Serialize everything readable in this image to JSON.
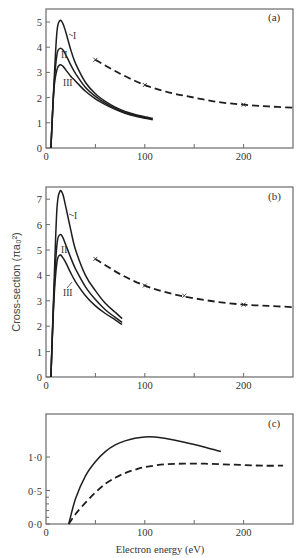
{
  "chart_data": [
    {
      "panel": "(a)",
      "type": "line",
      "xlim": [
        0,
        250
      ],
      "ylim": [
        0,
        5.5
      ],
      "x_ticks": [
        0,
        100,
        200
      ],
      "x_minor_ticks": [
        50,
        150
      ],
      "y_ticks": [
        0,
        1,
        2,
        3,
        4,
        5
      ],
      "series": [
        {
          "name": "I",
          "style": "solid",
          "x": [
            5,
            8,
            11,
            14,
            17,
            20,
            25,
            30,
            40,
            50,
            60,
            70,
            80,
            90,
            100,
            108
          ],
          "y": [
            0,
            2.5,
            4.6,
            5.05,
            4.95,
            4.6,
            3.9,
            3.35,
            2.6,
            2.15,
            1.85,
            1.62,
            1.45,
            1.33,
            1.24,
            1.18
          ]
        },
        {
          "name": "II",
          "style": "solid",
          "x": [
            5,
            8,
            11,
            14,
            17,
            20,
            25,
            30,
            40,
            50,
            60,
            70,
            80,
            90,
            100,
            108
          ],
          "y": [
            0,
            2.4,
            3.7,
            3.95,
            3.9,
            3.7,
            3.3,
            2.95,
            2.4,
            2.05,
            1.78,
            1.57,
            1.41,
            1.3,
            1.21,
            1.15
          ]
        },
        {
          "name": "III",
          "style": "solid",
          "x": [
            5,
            8,
            11,
            14,
            17,
            20,
            25,
            30,
            40,
            50,
            60,
            70,
            80,
            90,
            100,
            108
          ],
          "y": [
            0,
            2.3,
            3.1,
            3.3,
            3.25,
            3.1,
            2.85,
            2.65,
            2.25,
            1.95,
            1.72,
            1.53,
            1.38,
            1.27,
            1.18,
            1.12
          ]
        },
        {
          "name": "experiment",
          "style": "dashed",
          "markers": "x",
          "x": [
            50,
            75,
            100,
            125,
            150,
            175,
            200,
            225,
            250
          ],
          "y": [
            3.5,
            2.95,
            2.5,
            2.2,
            2.0,
            1.82,
            1.72,
            1.65,
            1.6
          ],
          "marker_points": [
            [
              50,
              3.5
            ],
            [
              100,
              2.5
            ],
            [
              200,
              1.72
            ]
          ]
        }
      ],
      "annotations": [
        "I",
        "II",
        "III",
        "(a)"
      ]
    },
    {
      "panel": "(b)",
      "type": "line",
      "xlim": [
        0,
        250
      ],
      "ylim": [
        0,
        7.5
      ],
      "x_ticks": [
        0,
        100,
        200
      ],
      "x_minor_ticks": [
        50,
        150
      ],
      "y_ticks": [
        0,
        1,
        2,
        3,
        4,
        5,
        6,
        7
      ],
      "ylabel": "Cross-section (πa₀²)",
      "series": [
        {
          "name": "I",
          "style": "solid",
          "x": [
            5,
            8,
            11,
            14,
            17,
            20,
            25,
            30,
            40,
            50,
            60,
            70,
            77
          ],
          "y": [
            0,
            3.5,
            6.6,
            7.3,
            7.2,
            6.7,
            5.8,
            5.0,
            4.0,
            3.4,
            2.9,
            2.55,
            2.3
          ]
        },
        {
          "name": "II",
          "style": "solid",
          "x": [
            5,
            8,
            11,
            14,
            17,
            20,
            25,
            30,
            40,
            50,
            60,
            70,
            77
          ],
          "y": [
            0,
            3.2,
            5.2,
            5.6,
            5.5,
            5.2,
            4.7,
            4.25,
            3.55,
            3.05,
            2.65,
            2.35,
            2.15
          ]
        },
        {
          "name": "III",
          "style": "solid",
          "x": [
            5,
            8,
            11,
            14,
            17,
            20,
            25,
            30,
            40,
            50,
            60,
            70,
            77
          ],
          "y": [
            0,
            3.0,
            4.5,
            4.8,
            4.7,
            4.5,
            4.1,
            3.75,
            3.2,
            2.8,
            2.5,
            2.25,
            2.07
          ]
        },
        {
          "name": "experiment",
          "style": "dashed",
          "markers": "x",
          "x": [
            50,
            75,
            100,
            125,
            150,
            175,
            200,
            225,
            250
          ],
          "y": [
            4.65,
            4.05,
            3.6,
            3.3,
            3.1,
            2.95,
            2.85,
            2.8,
            2.75
          ],
          "marker_points": [
            [
              50,
              4.65
            ],
            [
              100,
              3.6
            ],
            [
              140,
              3.2
            ],
            [
              200,
              2.85
            ]
          ]
        }
      ],
      "annotations": [
        "I",
        "II",
        "III",
        "(b)"
      ]
    },
    {
      "panel": "(c)",
      "type": "line",
      "xlim": [
        0,
        250
      ],
      "ylim": [
        0,
        1.6
      ],
      "x_ticks": [
        0,
        100,
        200
      ],
      "x_minor_ticks": [
        50,
        150
      ],
      "y_ticks": [
        0.0,
        0.5,
        1.0
      ],
      "y_tick_labels": [
        "0·0",
        "0·5",
        "1·0"
      ],
      "xlabel": "Electron energy (eV)",
      "series": [
        {
          "name": "solid",
          "style": "solid",
          "x": [
            23,
            30,
            40,
            50,
            60,
            70,
            80,
            90,
            100,
            110,
            120,
            140,
            160,
            177
          ],
          "y": [
            0,
            0.38,
            0.72,
            0.93,
            1.08,
            1.18,
            1.24,
            1.28,
            1.3,
            1.3,
            1.28,
            1.22,
            1.15,
            1.08
          ]
        },
        {
          "name": "dashed",
          "style": "dashed",
          "x": [
            23,
            30,
            40,
            50,
            60,
            70,
            80,
            90,
            100,
            120,
            140,
            160,
            180,
            200,
            220,
            240
          ],
          "y": [
            0,
            0.15,
            0.32,
            0.47,
            0.6,
            0.69,
            0.76,
            0.81,
            0.85,
            0.89,
            0.9,
            0.9,
            0.89,
            0.88,
            0.87,
            0.87
          ]
        }
      ],
      "annotations": [
        "(c)"
      ]
    }
  ],
  "labels": {
    "panel_a": "(a)",
    "panel_b": "(b)",
    "panel_c": "(c)",
    "curve_I": "I",
    "curve_II": "II",
    "curve_III": "III",
    "ylabel": "Cross-section (πa₀²)",
    "xlabel": "Electron energy  (eV)",
    "x_tick_0": "0",
    "x_tick_100": "100",
    "x_tick_200": "200",
    "c_y_0": "0·0",
    "c_y_05": "0·5",
    "c_y_10": "1·0"
  },
  "colors": {
    "ink": "#1e1e1e",
    "axis": "#6a6a6a",
    "background": "#ffffff"
  }
}
